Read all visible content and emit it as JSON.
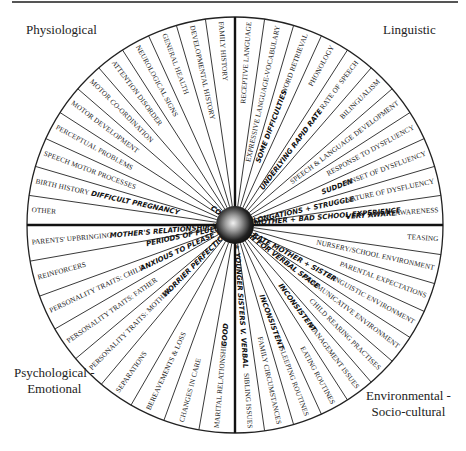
{
  "diagram": {
    "center": {
      "x": 235,
      "y": 225
    },
    "radius": 208,
    "hub_radius": 19,
    "colors": {
      "line": "#222222",
      "text": "#222222",
      "hub_dark": "#111111",
      "hub_light": "#e8e8e8",
      "background": "#ffffff"
    },
    "quadrants": {
      "top_left": {
        "label": "Physiological"
      },
      "top_right": {
        "label": "Linguistic"
      },
      "bottom_left": {
        "label_line1": "Psychological -",
        "label_line2": "Emotional"
      },
      "bottom_right": {
        "label_line1": "Environmental -",
        "label_line2": "Socio-cultural"
      }
    },
    "sectors": {
      "physiological": [
        {
          "label": "FAMILY HISTORY",
          "note": ""
        },
        {
          "label": "DEVELOPMENTAL HISTORY",
          "note": ""
        },
        {
          "label": "GENERAL HEALTH",
          "note": ""
        },
        {
          "label": "NEUROLOGICAL SIGNS",
          "note": ""
        },
        {
          "label": "ATTENTION DISORDER",
          "note": ""
        },
        {
          "label": "MOTOR CO-ORDINATION",
          "note": ""
        },
        {
          "label": "MOTOR DEVELOPMENT",
          "note": ""
        },
        {
          "label": "PERCEPTUAL PROBLEMS",
          "note": ""
        },
        {
          "label": "SPEECH MOTOR PROCESSES",
          "note": ""
        },
        {
          "label": "BIRTH HISTORY",
          "note": "DIFFICULT PREGNANCY"
        },
        {
          "label": "OTHER",
          "note": ""
        }
      ],
      "linguistic": [
        {
          "label": "RECEPTIVE LANGUAGE",
          "note": ""
        },
        {
          "label": "EXPRESSIVE LANGUAGE-VOCABULARY",
          "note": ""
        },
        {
          "label": "WORD RETRIEVAL",
          "note": "SOME DIFFICULTIES"
        },
        {
          "label": "PHONOLOGY",
          "note": ""
        },
        {
          "label": "RATE OF SPEECH",
          "note": "UNDERLYING RAPID RATE"
        },
        {
          "label": "BILINGUALISM",
          "note": ""
        },
        {
          "label": "SPEECH & LANGUAGE DEVELOPMENT",
          "note": ""
        },
        {
          "label": "RESPONSE TO DYSFLUENCY",
          "note": ""
        },
        {
          "label": "ONSET OF DYSFLUENCY",
          "note": "SUDDEN"
        },
        {
          "label": "NATURE OF DYSFLUENCY",
          "note": "PERIODS OF FLUENCY / PROLONGATIONS + STRUGGLE"
        },
        {
          "label": "AWARENESS",
          "note": "VERY AWARE"
        }
      ],
      "environmental": [
        {
          "label": "TEASING",
          "note": ""
        },
        {
          "label": "NURSERY/SCHOOL ENVIRONMENT",
          "note": ""
        },
        {
          "label": "PARENTAL EXPECTATIONS",
          "note": ""
        },
        {
          "label": "LINGUISTIC ENVIRONMENT",
          "note": "RAPID RATE MOTHER + SISTER"
        },
        {
          "label": "COMMUNICATIVE ENVIRONMENT",
          "note": "COMPETITION FOR VERBAL SPACE"
        },
        {
          "label": "CHILD REARING PRACTISES",
          "note": ""
        },
        {
          "label": "MANAGEMENT ISSUES",
          "note": "INCONSISTENT"
        },
        {
          "label": "EATING ROUTINES",
          "note": ""
        },
        {
          "label": "SLEEPING ROUTINES",
          "note": "INCONSISTENT"
        },
        {
          "label": "FAMILY CIRCUMSTANCES",
          "note": ""
        },
        {
          "label": "SIBLING ISSUES",
          "note": "OLDER + YOUNGER SISTERS V. VERBAL"
        }
      ],
      "psychological": [
        {
          "label": "MARITAL RELATIONSHIP",
          "note": "GOOD"
        },
        {
          "label": "CHANGES IN CARE",
          "note": ""
        },
        {
          "label": "BEREAVEMENTS & LOSS",
          "note": ""
        },
        {
          "label": "SEPARATIONS",
          "note": ""
        },
        {
          "label": "PERSONALITY TRAITS: MOTHER",
          "note": "WORRIER PERFECTIONIST"
        },
        {
          "label": "PERSONALITY TRAITS: FATHER",
          "note": ""
        },
        {
          "label": "PERSONALITY TRAITS: CHILD",
          "note": "ANXIOUS TO PLEASE WORRIER"
        },
        {
          "label": "REINFORCERS",
          "note": ""
        },
        {
          "label": "PARENTS' UPBRINGING",
          "note": "MOTHER'S RELATIONSHIP WITH HER MOTHER + BAD SCHOOL EXPERIENCE"
        }
      ]
    }
  }
}
